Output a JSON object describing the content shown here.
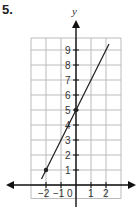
{
  "problem": {
    "number": "5."
  },
  "chart_data": {
    "type": "line",
    "title": "",
    "xlabel": "",
    "ylabel": "y",
    "xlim": [
      -3,
      3
    ],
    "ylim": [
      -1,
      10
    ],
    "grid": true,
    "x_tick_labels": [
      "-2",
      "-1",
      "0",
      "1",
      "2"
    ],
    "y_tick_labels": [
      "1",
      "2",
      "3",
      "4",
      "5",
      "6",
      "7",
      "8",
      "9"
    ],
    "series": [
      {
        "name": "line",
        "equation": "y = 2x + 5",
        "x": [
          -2.3,
          2.2
        ],
        "y": [
          0.4,
          9.4
        ],
        "marked_points": [
          {
            "x": -2,
            "y": 1
          },
          {
            "x": 0,
            "y": 5
          }
        ]
      }
    ],
    "colors": {
      "line": "#222222",
      "grid": "#bbbbbb",
      "axis": "#111111"
    }
  }
}
